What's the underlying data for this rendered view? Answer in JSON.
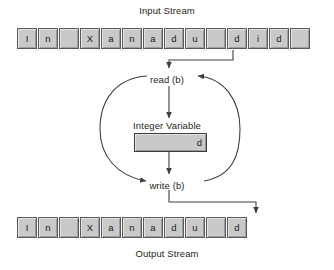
{
  "diagram": {
    "input_stream": {
      "title": "Input Stream",
      "cells": [
        "I",
        "n",
        "",
        "X",
        "a",
        "n",
        "a",
        "d",
        "u",
        "",
        "d",
        "i",
        "d",
        ""
      ]
    },
    "output_stream": {
      "title": "Output Stream",
      "cells": [
        "I",
        "n",
        "",
        "X",
        "a",
        "n",
        "a",
        "d",
        "u",
        "",
        "d"
      ]
    },
    "loop": {
      "read_label": "read (b)",
      "write_label": "write (b)"
    },
    "variable": {
      "caption": "Integer Variable",
      "value": "d"
    },
    "colors": {
      "cell_fill": "#c9c9c9",
      "cell_border": "#5b5b5b",
      "line": "#3f3f3f",
      "text": "#231f20",
      "background": "#ffffff"
    }
  }
}
